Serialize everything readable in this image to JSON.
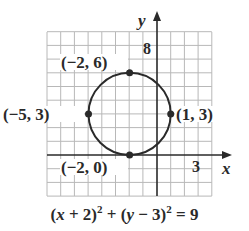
{
  "diagram": {
    "type": "circle-on-coordinate-grid",
    "axes": {
      "x_label": "x",
      "y_label": "y",
      "x_tick_label": "3",
      "y_tick_label": "8"
    },
    "grid": {
      "x_min": -8,
      "x_max": 4,
      "y_min": -3,
      "y_max": 9
    },
    "circle": {
      "center": [
        -2,
        3
      ],
      "radius": 3
    },
    "points": [
      {
        "label": "(−2, 6)",
        "x": -2,
        "y": 6
      },
      {
        "label": "(−5, 3)",
        "x": -5,
        "y": 3
      },
      {
        "label": "(1, 3)",
        "x": 1,
        "y": 3
      },
      {
        "label": "(−2, 0)",
        "x": -2,
        "y": 0
      }
    ],
    "equation": {
      "part1": "(",
      "x": "x",
      "part2": " + 2)",
      "exp1": "2",
      "part3": " + (",
      "y": "y",
      "part4": " − 3)",
      "exp2": "2",
      "part5": " = 9"
    },
    "colors": {
      "ink": "#2a2a2a",
      "grid": "#b8b8b8"
    }
  }
}
